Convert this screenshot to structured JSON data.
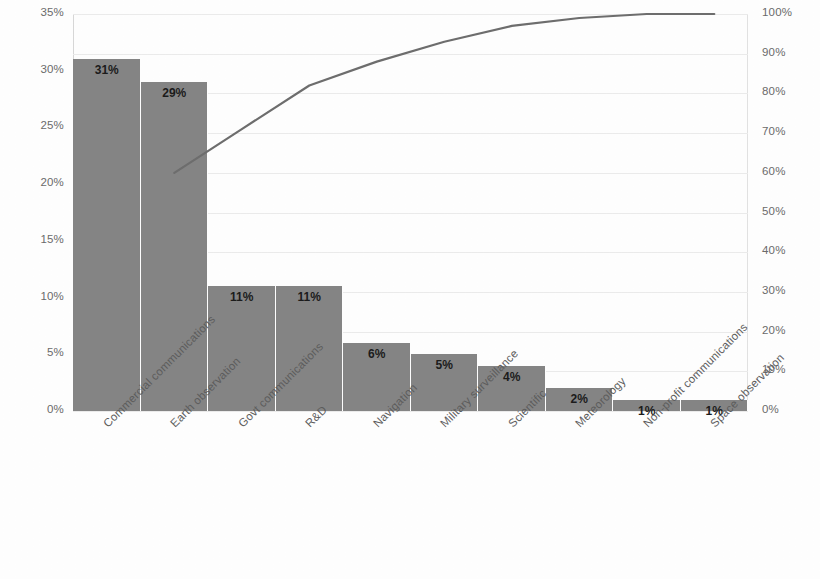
{
  "chart_data": {
    "type": "bar",
    "title": "",
    "subtitle": "",
    "xlabel": "",
    "ylabel": "",
    "y2label": "",
    "grid": true,
    "legend": "none",
    "categories": [
      "Commercial communications",
      "Earth observation",
      "Govt communications",
      "R&D",
      "Navigation",
      "Military surveillance",
      "Scientific",
      "Meteorology",
      "Non-profit communications",
      "Space observation"
    ],
    "series": [
      {
        "name": "Share",
        "type": "bar",
        "values": [
          31,
          29,
          11,
          11,
          6,
          5,
          4,
          2,
          1,
          1
        ],
        "labels": [
          "31%",
          "29%",
          "11%",
          "11%",
          "6%",
          "5%",
          "4%",
          "2%",
          "1%",
          "1%"
        ],
        "axis": "left",
        "color": "#858585"
      },
      {
        "name": "Cumulative",
        "type": "line",
        "values": [
          31,
          60,
          71,
          82,
          88,
          93,
          97,
          99,
          100,
          100
        ],
        "axis": "right",
        "color": "#6e6e6e",
        "visible_from_index": 1
      }
    ],
    "ylim": [
      0,
      35
    ],
    "y2lim": [
      0,
      100
    ],
    "yticks": [
      0,
      5,
      10,
      15,
      20,
      25,
      30,
      35
    ],
    "ytick_labels": [
      "0%",
      "5%",
      "10%",
      "15%",
      "20%",
      "25%",
      "30%",
      "35%"
    ],
    "y2ticks": [
      0,
      10,
      20,
      30,
      40,
      50,
      60,
      70,
      80,
      90,
      100
    ],
    "y2tick_labels": [
      "0%",
      "10%",
      "20%",
      "30%",
      "40%",
      "50%",
      "60%",
      "70%",
      "80%",
      "90%",
      "100%"
    ]
  }
}
